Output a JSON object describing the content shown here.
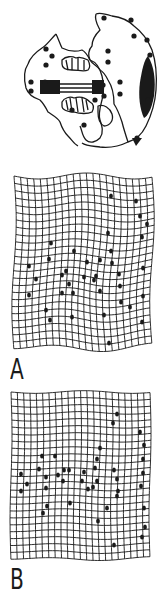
{
  "figure": {
    "ink_color": "#1a1a1a",
    "background": "#ffffff",
    "skull": {
      "description": "ventral view skull outline with black landmark dots",
      "landmarks": [
        [
          104,
          18
        ],
        [
          131,
          20
        ],
        [
          134,
          36
        ],
        [
          147,
          40
        ],
        [
          150,
          55
        ],
        [
          148,
          68
        ],
        [
          108,
          51
        ],
        [
          108,
          62
        ],
        [
          46,
          49
        ],
        [
          46,
          65
        ],
        [
          52,
          56
        ],
        [
          31,
          82
        ],
        [
          31,
          91
        ],
        [
          103,
          85
        ],
        [
          104,
          96
        ],
        [
          95,
          100
        ],
        [
          120,
          82
        ],
        [
          120,
          94
        ],
        [
          148,
          100
        ],
        [
          137,
          138
        ],
        [
          84,
          125
        ],
        [
          72,
          110
        ],
        [
          45,
          82
        ]
      ]
    },
    "panels": [
      {
        "id": "A",
        "label": "A",
        "grid": {
          "x": 14,
          "y": 176,
          "width": 138,
          "height": 170,
          "cols": 21,
          "rows": 24,
          "warp": "strong"
        },
        "landmarks": [
          [
            111,
            196
          ],
          [
            136,
            201
          ],
          [
            140,
            216
          ],
          [
            147,
            224
          ],
          [
            108,
            233
          ],
          [
            142,
            237
          ],
          [
            51,
            243
          ],
          [
            49,
            259
          ],
          [
            74,
            251
          ],
          [
            111,
            251
          ],
          [
            112,
            263
          ],
          [
            29,
            266
          ],
          [
            36,
            279
          ],
          [
            62,
            275
          ],
          [
            66,
            271
          ],
          [
            69,
            284
          ],
          [
            84,
            277
          ],
          [
            96,
            276
          ],
          [
            87,
            262
          ],
          [
            100,
            260
          ],
          [
            94,
            280
          ],
          [
            100,
            291
          ],
          [
            119,
            274
          ],
          [
            120,
            286
          ],
          [
            121,
            302
          ],
          [
            143,
            268
          ],
          [
            143,
            296
          ],
          [
            29,
            295
          ],
          [
            62,
            293
          ],
          [
            73,
            293
          ],
          [
            46,
            310
          ],
          [
            50,
            320
          ],
          [
            72,
            317
          ],
          [
            104,
            315
          ],
          [
            130,
            307
          ],
          [
            142,
            322
          ],
          [
            109,
            343
          ]
        ]
      },
      {
        "id": "B",
        "label": "B",
        "grid": {
          "x": 11,
          "y": 392,
          "width": 139,
          "height": 166,
          "cols": 22,
          "rows": 24,
          "warp": "mild"
        },
        "landmarks": [
          [
            117,
            414
          ],
          [
            113,
            423
          ],
          [
            140,
            432
          ],
          [
            144,
            445
          ],
          [
            143,
            459
          ],
          [
            100,
            448
          ],
          [
            97,
            459
          ],
          [
            42,
            456
          ],
          [
            39,
            469
          ],
          [
            114,
            470
          ],
          [
            55,
            456
          ],
          [
            69,
            470
          ],
          [
            143,
            473
          ],
          [
            21,
            474
          ],
          [
            27,
            484
          ],
          [
            21,
            491
          ],
          [
            46,
            477
          ],
          [
            46,
            488
          ],
          [
            58,
            475
          ],
          [
            64,
            470
          ],
          [
            63,
            481
          ],
          [
            82,
            481
          ],
          [
            84,
            472
          ],
          [
            88,
            489
          ],
          [
            95,
            468
          ],
          [
            97,
            481
          ],
          [
            93,
            487
          ],
          [
            117,
            479
          ],
          [
            118,
            491
          ],
          [
            117,
            496
          ],
          [
            141,
            486
          ],
          [
            70,
            503
          ],
          [
            47,
            506
          ],
          [
            43,
            513
          ],
          [
            107,
            508
          ],
          [
            144,
            508
          ],
          [
            98,
            521
          ],
          [
            145,
            527
          ],
          [
            142,
            537
          ],
          [
            114,
            545
          ]
        ]
      }
    ]
  }
}
